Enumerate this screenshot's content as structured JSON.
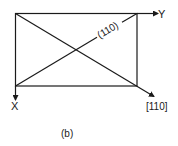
{
  "diagram": {
    "caption": "(b)",
    "axis_y_label": "Y",
    "axis_x_label": "X",
    "plane_label": "(110)",
    "direction_label": "[110]",
    "stroke_color": "#1a1a1a",
    "background_color": "#ffffff"
  }
}
